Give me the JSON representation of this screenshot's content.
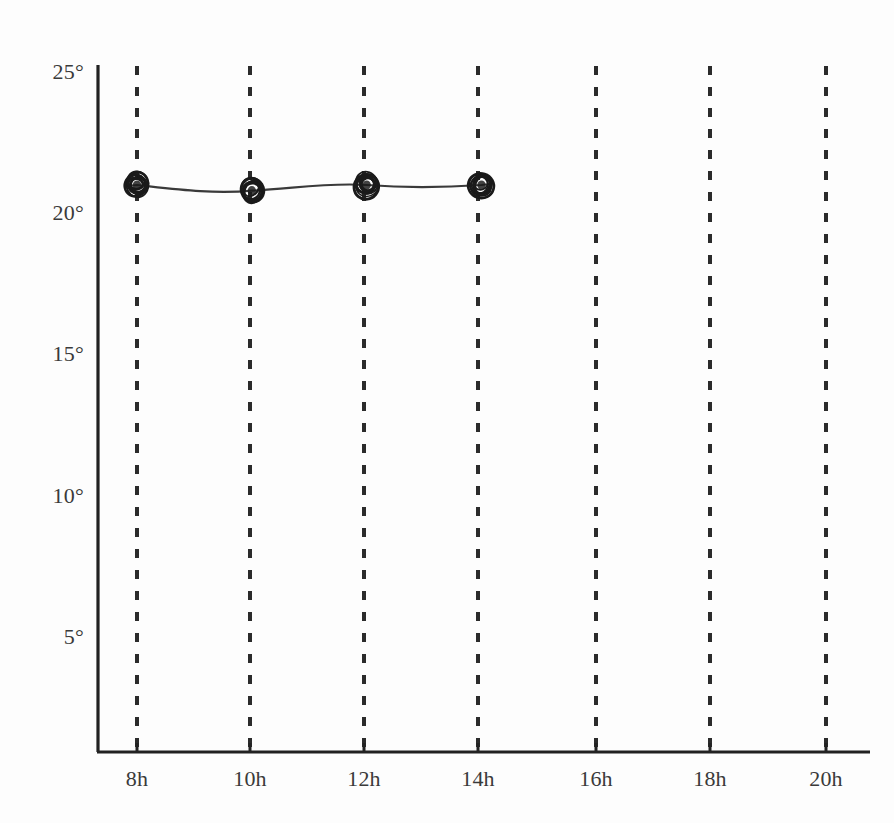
{
  "chart_data": {
    "type": "line",
    "title": "",
    "subtitle": "",
    "xlabel": "",
    "ylabel": "",
    "x": [
      8,
      10,
      12,
      14
    ],
    "x_display": [
      "8h",
      "10h",
      "12h",
      "14h"
    ],
    "values": [
      21,
      20.8,
      21,
      21
    ],
    "series": [
      {
        "name": "temperature",
        "values": [
          21,
          20.8,
          21,
          21
        ],
        "marker": "scribble-circle",
        "marker_color": "#1a1a1a",
        "line_color": "#3a3a3a"
      }
    ],
    "x_ticks": [
      8,
      10,
      12,
      14,
      16,
      18,
      20
    ],
    "x_tick_labels": [
      "8h",
      "10h",
      "12h",
      "14h",
      "16h",
      "18h",
      "20h"
    ],
    "xlim": [
      7.2,
      20.4
    ],
    "y_ticks": [
      5,
      10,
      15,
      20,
      25
    ],
    "y_tick_labels": [
      "5°",
      "10°",
      "15°",
      "20°",
      "25°"
    ],
    "ylim": [
      1.0,
      25.0
    ],
    "grid": "vertical-dashed-at-x-ticks",
    "legend": "none",
    "annotations": []
  },
  "axes": {
    "y_axis_name": "temperature-axis",
    "x_axis_name": "time-axis",
    "axis_color": "#222222",
    "gridline_color": "#2b2b2b",
    "background_color": "#fdfdfd"
  },
  "geometry": {
    "plot_left": 98,
    "plot_right": 870,
    "plot_top": 66,
    "plot_bottom": 752,
    "x_pixels": [
      137,
      250,
      364,
      478,
      596,
      710,
      826
    ],
    "y_pixels": [
      637,
      496,
      354,
      213,
      72
    ]
  }
}
